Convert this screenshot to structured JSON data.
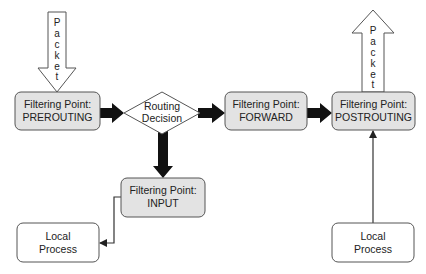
{
  "diagram": {
    "type": "flowchart",
    "colors": {
      "background": "#ffffff",
      "filter_box_fill": "#e3e3e3",
      "process_box_fill": "#ffffff",
      "stroke": "#555555",
      "thick_arrow": "#111111",
      "text": "#222222"
    },
    "packet_in": {
      "letters": [
        "P",
        "a",
        "c",
        "k",
        "e",
        "t"
      ],
      "direction": "down"
    },
    "packet_out": {
      "letters": [
        "P",
        "a",
        "c",
        "k",
        "e",
        "t"
      ],
      "direction": "up"
    },
    "nodes": {
      "prerouting": {
        "line1": "Filtering Point:",
        "line2": "PREROUTING"
      },
      "routing": {
        "line1": "Routing",
        "line2": "Decision"
      },
      "forward": {
        "line1": "Filtering Point:",
        "line2": "FORWARD"
      },
      "postrouting": {
        "line1": "Filtering Point:",
        "line2": "POSTROUTING"
      },
      "input": {
        "line1": "Filtering Point:",
        "line2": "INPUT"
      },
      "local_in": {
        "line1": "Local",
        "line2": "Process"
      },
      "local_out": {
        "line1": "Local",
        "line2": "Process"
      }
    },
    "edges": [
      {
        "from": "packet_in",
        "to": "prerouting",
        "style": "hollow-block"
      },
      {
        "from": "prerouting",
        "to": "routing",
        "style": "thick"
      },
      {
        "from": "routing",
        "to": "forward",
        "style": "thick"
      },
      {
        "from": "forward",
        "to": "postrouting",
        "style": "thick"
      },
      {
        "from": "routing",
        "to": "input",
        "style": "thick"
      },
      {
        "from": "input",
        "to": "local_in",
        "style": "thin-elbow"
      },
      {
        "from": "local_out",
        "to": "postrouting",
        "style": "thin"
      },
      {
        "from": "postrouting",
        "to": "packet_out",
        "style": "hollow-block"
      }
    ]
  }
}
